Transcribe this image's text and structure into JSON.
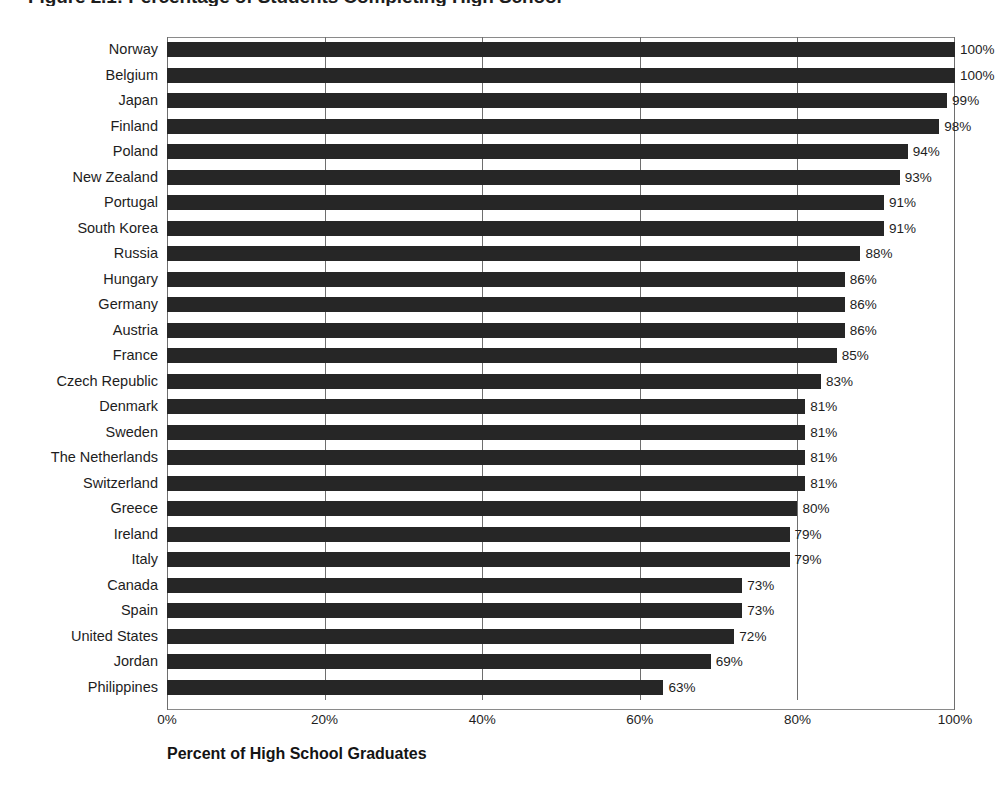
{
  "chart_data": {
    "type": "bar",
    "orientation": "horizontal",
    "title": "Figure 2.1: Percentage of Students Completing High School",
    "xlabel": "Percent of High School Graduates",
    "ylabel": "",
    "xlim": [
      0,
      100
    ],
    "xticks": [
      "0%",
      "20%",
      "40%",
      "60%",
      "80%",
      "100%"
    ],
    "xtick_values": [
      0,
      20,
      40,
      60,
      80,
      100
    ],
    "grid": true,
    "grid_axis": "x",
    "legend": "none",
    "bar_color": "#262626",
    "value_label_suffix": "%",
    "categories": [
      "Norway",
      "Belgium",
      "Japan",
      "Finland",
      "Poland",
      "New Zealand",
      "Portugal",
      "South Korea",
      "Russia",
      "Hungary",
      "Germany",
      "Austria",
      "France",
      "Czech Republic",
      "Denmark",
      "Sweden",
      "The Netherlands",
      "Switzerland",
      "Greece",
      "Ireland",
      "Italy",
      "Canada",
      "Spain",
      "United States",
      "Jordan",
      "Philippines"
    ],
    "values": [
      100,
      100,
      99,
      98,
      94,
      93,
      91,
      91,
      88,
      86,
      86,
      86,
      85,
      83,
      81,
      81,
      81,
      81,
      80,
      79,
      79,
      73,
      73,
      72,
      69,
      63
    ],
    "value_labels": [
      "100%",
      "100%",
      "99%",
      "98%",
      "94%",
      "93%",
      "91%",
      "91%",
      "88%",
      "86%",
      "86%",
      "86%",
      "85%",
      "83%",
      "81%",
      "81%",
      "81%",
      "81%",
      "80%",
      "79%",
      "79%",
      "73%",
      "73%",
      "72%",
      "69%",
      "63%"
    ]
  }
}
